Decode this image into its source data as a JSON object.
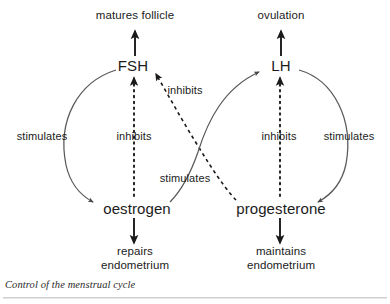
{
  "figure": {
    "caption": "Control of the menstrual cycle",
    "background_color": "#ffffff",
    "ink_color": "#1a1a1a",
    "rule_color": "#cfcfcf"
  },
  "nodes": {
    "matures_follicle": "matures follicle",
    "ovulation": "ovulation",
    "fsh": "FSH",
    "lh": "LH",
    "oestrogen": "oestrogen",
    "progesterone": "progesterone",
    "repairs_endometrium_line1": "repairs",
    "repairs_endometrium_line2": "endometrium",
    "maintains_endometrium_line1": "maintains",
    "maintains_endometrium_line2": "endometrium"
  },
  "edge_labels": {
    "fsh_to_oestrogen": "stimulates",
    "oestrogen_to_fsh": "inhibits",
    "progesterone_to_fsh": "inhibits",
    "oestrogen_to_lh": "stimulates",
    "progesterone_to_lh": "inhibits",
    "lh_to_progesterone": "stimulates"
  },
  "edges": [
    {
      "from": "FSH",
      "to": "matures follicle",
      "label": "",
      "style": "solid"
    },
    {
      "from": "LH",
      "to": "ovulation",
      "label": "",
      "style": "solid"
    },
    {
      "from": "FSH",
      "to": "oestrogen",
      "label": "stimulates",
      "style": "solid"
    },
    {
      "from": "oestrogen",
      "to": "FSH",
      "label": "inhibits",
      "style": "dotted"
    },
    {
      "from": "progesterone",
      "to": "FSH",
      "label": "inhibits",
      "style": "dashed"
    },
    {
      "from": "oestrogen",
      "to": "LH",
      "label": "stimulates",
      "style": "solid"
    },
    {
      "from": "progesterone",
      "to": "LH",
      "label": "inhibits",
      "style": "dotted"
    },
    {
      "from": "LH",
      "to": "progesterone",
      "label": "stimulates",
      "style": "solid"
    },
    {
      "from": "oestrogen",
      "to": "repairs endometrium",
      "label": "",
      "style": "solid"
    },
    {
      "from": "progesterone",
      "to": "maintains endometrium",
      "label": "",
      "style": "solid"
    }
  ]
}
